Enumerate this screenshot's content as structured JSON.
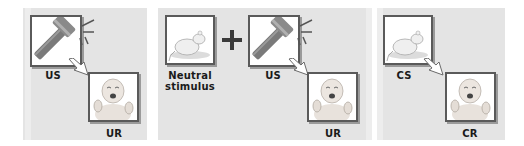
{
  "panels": [
    {
      "id": "before-conditioning",
      "stimulus_label": "US",
      "stimulus_icon": "hammer-icon",
      "response_label": "UR",
      "response_icon": "crying-baby-icon"
    },
    {
      "id": "during-conditioning",
      "neutral_label": "Neutral stimulus",
      "neutral_label_line1": "Neutral",
      "neutral_label_line2": "stimulus",
      "neutral_icon": "rat-icon",
      "operator": "+",
      "stimulus_label": "US",
      "stimulus_icon": "hammer-icon",
      "response_label": "UR",
      "response_icon": "crying-baby-icon"
    },
    {
      "id": "after-conditioning",
      "stimulus_label": "CS",
      "stimulus_icon": "rat-icon",
      "response_label": "CR",
      "response_icon": "crying-baby-icon"
    }
  ],
  "colors": {
    "panel_background": "#e4e4e4",
    "frame_border": "#5a5a5a",
    "hammer_head": "#8a8a8a",
    "hammer_handle": "#7a7a7a",
    "plus_sign": "#3a3a3a"
  }
}
